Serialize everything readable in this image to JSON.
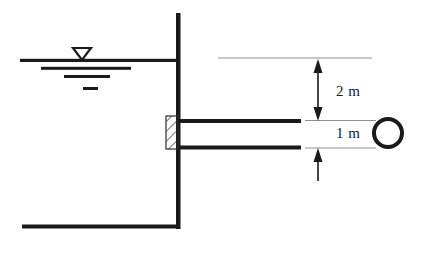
{
  "diagram": {
    "type": "engineering-schematic",
    "canvas": {
      "width": 421,
      "height": 254,
      "background": "#ffffff"
    },
    "colors": {
      "structure": "#1a1a1a",
      "dimension_line": "#8a8a8a",
      "hatch": "#2a2a2a",
      "text": "#1a1a1a",
      "background": "#ffffff"
    },
    "labels": {
      "upper_dimension": "2 m",
      "lower_dimension": "1 m"
    },
    "elements": {
      "reservoir_wall": {
        "name": "vertical-wall",
        "x": 178,
        "y_top": 13,
        "y_bottom": 228,
        "thickness": 4
      },
      "reservoir_floor": {
        "name": "floor-line",
        "x_start": 22,
        "x_end": 180,
        "y": 226,
        "thickness": 4
      },
      "water_surface": {
        "name": "water-surface-line",
        "x_start": 20,
        "x_end": 178,
        "y": 60,
        "thickness": 3
      },
      "water_symbol_lines": [
        {
          "x_start": 41,
          "x_end": 131,
          "y": 68,
          "thickness": 3
        },
        {
          "x_start": 64,
          "x_end": 110,
          "y": 76,
          "thickness": 3
        },
        {
          "x_start": 83,
          "x_end": 97,
          "y": 88,
          "thickness": 3
        }
      ],
      "water_triangle": {
        "name": "water-level-triangle",
        "cx": 82,
        "top_y": 48,
        "half_width": 9,
        "height": 12,
        "filled": false
      },
      "gate": {
        "name": "hatched-gate",
        "x": 166,
        "y": 116,
        "width": 12,
        "height": 33,
        "hatch": "diagonal"
      },
      "pipe_top": {
        "name": "pipe-top-wall",
        "x_start": 178,
        "x_end": 301,
        "y": 121,
        "thickness": 4
      },
      "pipe_bottom": {
        "name": "pipe-bottom-wall",
        "x_start": 178,
        "x_end": 301,
        "y": 147,
        "thickness": 4
      },
      "datum_line": {
        "name": "upper-datum-line",
        "x_start": 218,
        "x_end": 372,
        "y": 58
      },
      "pipe_top_extension": {
        "name": "pipe-top-extension-line",
        "x_start": 305,
        "x_end": 376,
        "y": 121
      },
      "pipe_bottom_extension": {
        "name": "pipe-bottom-extension-line",
        "x_start": 305,
        "x_end": 376,
        "y": 148
      },
      "upper_arrow": {
        "name": "upper-dimension-arrow",
        "x": 318,
        "y_top": 59,
        "y_bottom": 120,
        "heads": "both"
      },
      "lower_arrow": {
        "name": "lower-dimension-arrow",
        "x": 318,
        "y_top": 148,
        "y_bottom": 180,
        "heads": "up"
      },
      "pipe_circle": {
        "name": "pipe-cross-section-circle",
        "cx": 388,
        "cy": 133,
        "r": 14,
        "stroke_width": 4
      }
    }
  }
}
